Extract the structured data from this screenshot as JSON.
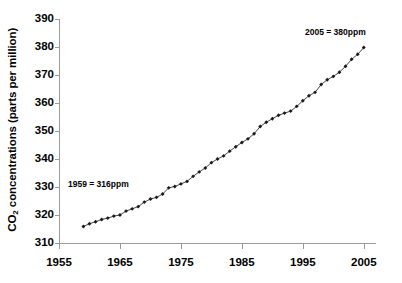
{
  "chart_data": {
    "type": "line",
    "title": "",
    "xlabel": "",
    "ylabel": "CO2 concentrations (parts per million)",
    "ylabel_prefix": "CO",
    "ylabel_sub": "2",
    "ylabel_suffix": " concentrations (parts per million)",
    "xlim": [
      1955,
      2007
    ],
    "ylim": [
      310,
      390
    ],
    "yticks": [
      310,
      320,
      330,
      340,
      350,
      360,
      370,
      380,
      390
    ],
    "xticks": [
      1955,
      1965,
      1975,
      1985,
      1995,
      2005
    ],
    "grid": false,
    "legend": false,
    "marker": "diamond",
    "line_color": "#333333",
    "marker_color": "#1a1a1a",
    "axis_color": "#9a9a9a",
    "annotations": [
      {
        "id": "annotation-start",
        "text": "1959 = 316ppm",
        "year": 1959,
        "value": 316
      },
      {
        "id": "annotation-end",
        "text": "2005 = 380ppm",
        "year": 2005,
        "value": 380
      }
    ],
    "x": [
      1959,
      1960,
      1961,
      1962,
      1963,
      1964,
      1965,
      1966,
      1967,
      1968,
      1969,
      1970,
      1971,
      1972,
      1973,
      1974,
      1975,
      1976,
      1977,
      1978,
      1979,
      1980,
      1981,
      1982,
      1983,
      1984,
      1985,
      1986,
      1987,
      1988,
      1989,
      1990,
      1991,
      1992,
      1993,
      1994,
      1995,
      1996,
      1997,
      1998,
      1999,
      2000,
      2001,
      2002,
      2003,
      2004,
      2005
    ],
    "values": [
      315.9,
      316.9,
      317.6,
      318.4,
      318.9,
      319.6,
      320.0,
      321.4,
      322.2,
      323.0,
      324.6,
      325.7,
      326.3,
      327.5,
      329.7,
      330.2,
      331.1,
      332.0,
      333.8,
      335.4,
      336.8,
      338.7,
      340.0,
      341.1,
      342.8,
      344.4,
      345.9,
      347.2,
      349.0,
      351.6,
      353.1,
      354.4,
      355.6,
      356.4,
      357.1,
      358.8,
      360.8,
      362.6,
      363.8,
      366.6,
      368.3,
      369.5,
      371.0,
      373.1,
      375.6,
      377.4,
      379.8
    ],
    "series": [
      {
        "name": "Atmospheric CO2 concentration",
        "values": [
          315.9,
          316.9,
          317.6,
          318.4,
          318.9,
          319.6,
          320.0,
          321.4,
          322.2,
          323.0,
          324.6,
          325.7,
          326.3,
          327.5,
          329.7,
          330.2,
          331.1,
          332.0,
          333.8,
          335.4,
          336.8,
          338.7,
          340.0,
          341.1,
          342.8,
          344.4,
          345.9,
          347.2,
          349.0,
          351.6,
          353.1,
          354.4,
          355.6,
          356.4,
          357.1,
          358.8,
          360.8,
          362.6,
          363.8,
          366.6,
          368.3,
          369.5,
          371.0,
          373.1,
          375.6,
          377.4,
          379.8
        ]
      }
    ]
  }
}
